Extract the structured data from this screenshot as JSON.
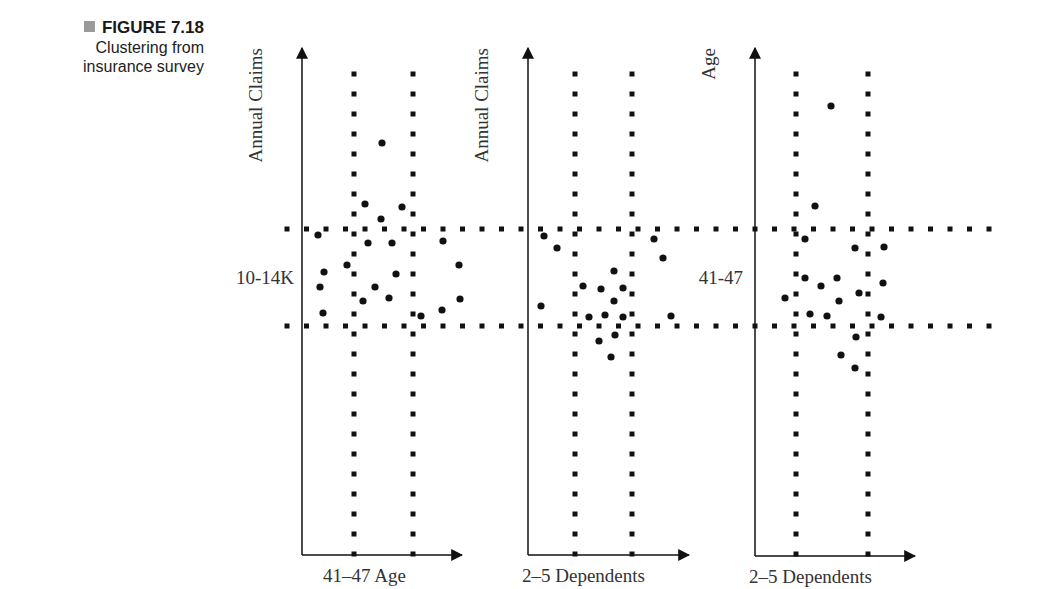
{
  "caption": {
    "figure_label": "FIGURE 7.18",
    "line1": "Clustering from",
    "line2": "insurance survey",
    "marker_color": "#9a9a9a"
  },
  "chart_data": [
    {
      "type": "scatter",
      "title": "Annual Claims vs Age",
      "ylabel": "Annual Claims",
      "xlabel": "41–47 Age",
      "band_y_label": "10-14K",
      "axis": {
        "x0": 302,
        "y0": 555,
        "x1": 462,
        "y1": 48
      },
      "v_bands": [
        354,
        413
      ],
      "points": [
        [
          382,
          143
        ],
        [
          365,
          204
        ],
        [
          402,
          207
        ],
        [
          381,
          219
        ],
        [
          318,
          235
        ],
        [
          368,
          243
        ],
        [
          392,
          243
        ],
        [
          443,
          241
        ],
        [
          347,
          265
        ],
        [
          459,
          265
        ],
        [
          324,
          272
        ],
        [
          396,
          274
        ],
        [
          320,
          287
        ],
        [
          375,
          287
        ],
        [
          389,
          298
        ],
        [
          460,
          299
        ],
        [
          363,
          301
        ],
        [
          442,
          310
        ],
        [
          323,
          313
        ],
        [
          421,
          316
        ]
      ]
    },
    {
      "type": "scatter",
      "title": "Annual Claims vs Dependents",
      "ylabel": "Annual Claims",
      "xlabel": "2–5 Dependents",
      "band_y_label": "",
      "axis": {
        "x0": 528,
        "y0": 555,
        "x1": 689,
        "y1": 48
      },
      "v_bands": [
        575,
        632
      ],
      "points": [
        [
          544,
          236
        ],
        [
          557,
          248
        ],
        [
          654,
          239
        ],
        [
          663,
          258
        ],
        [
          614,
          271
        ],
        [
          583,
          286
        ],
        [
          601,
          289
        ],
        [
          623,
          288
        ],
        [
          614,
          301
        ],
        [
          541,
          306
        ],
        [
          589,
          317
        ],
        [
          605,
          315
        ],
        [
          623,
          317
        ],
        [
          671,
          316
        ],
        [
          615,
          335
        ],
        [
          599,
          341
        ],
        [
          611,
          357
        ]
      ]
    },
    {
      "type": "scatter",
      "title": "Age vs Dependents",
      "ylabel": "Age",
      "xlabel": "2–5 Dependents",
      "band_y_label": "41-47",
      "axis": {
        "x0": 755,
        "y0": 556,
        "x1": 915,
        "y1": 48
      },
      "v_bands": [
        796,
        868
      ],
      "points": [
        [
          831,
          106
        ],
        [
          815,
          206
        ],
        [
          805,
          239
        ],
        [
          855,
          248
        ],
        [
          884,
          247
        ],
        [
          805,
          278
        ],
        [
          837,
          278
        ],
        [
          821,
          286
        ],
        [
          883,
          283
        ],
        [
          859,
          293
        ],
        [
          785,
          298
        ],
        [
          839,
          301
        ],
        [
          810,
          314
        ],
        [
          827,
          316
        ],
        [
          881,
          317
        ],
        [
          856,
          337
        ],
        [
          841,
          355
        ],
        [
          855,
          368
        ]
      ]
    }
  ],
  "h_bands": {
    "y": [
      229,
      326
    ],
    "x_start": 287,
    "x_end": 995
  },
  "v_band_range": {
    "y_start": 74,
    "y_end": 570
  }
}
